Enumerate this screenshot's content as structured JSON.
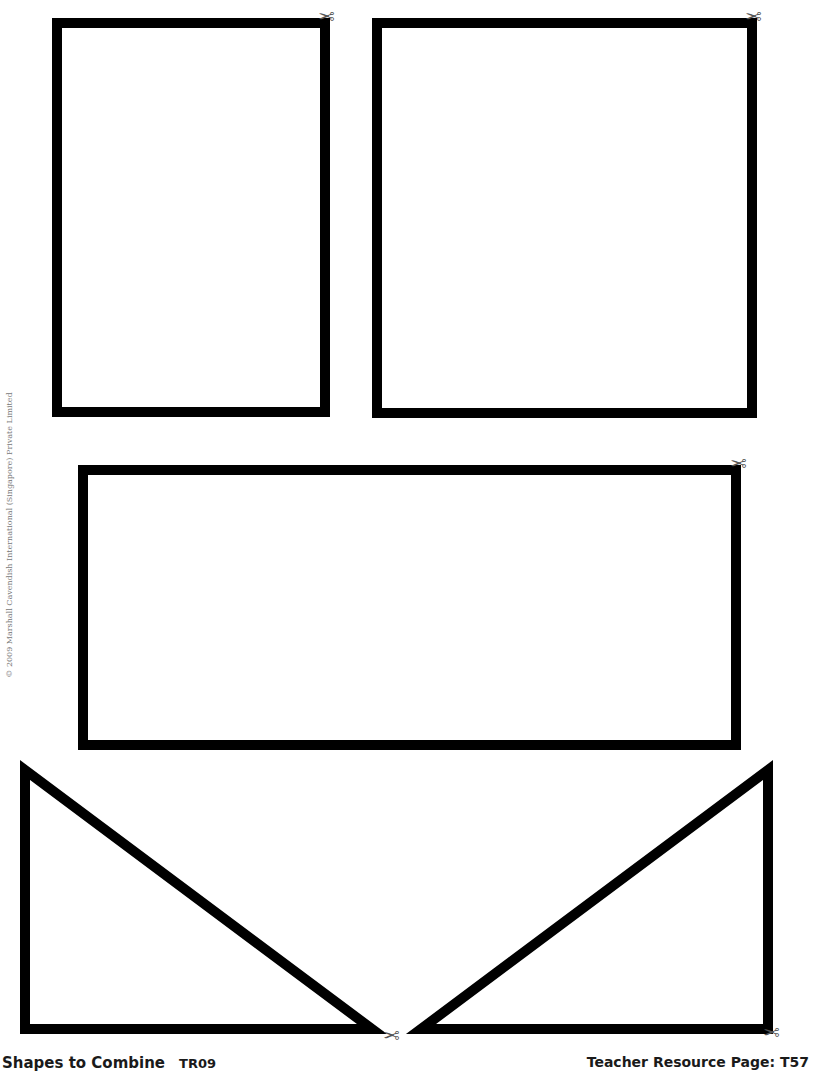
{
  "page": {
    "title": "Shapes to Combine",
    "code": "TR09",
    "page_label": "Teacher Resource Page: T57",
    "copyright": "© 2009 Marshall Cavendish International (Singapore) Private Limited"
  },
  "shapes": [
    {
      "type": "rectangle",
      "name": "rectangle-small",
      "x": 57,
      "y": 23,
      "w": 268,
      "h": 389
    },
    {
      "type": "rectangle",
      "name": "rectangle-square",
      "x": 377,
      "y": 23,
      "w": 375,
      "h": 390
    },
    {
      "type": "rectangle",
      "name": "rectangle-wide",
      "x": 83,
      "y": 470,
      "w": 653,
      "h": 275
    },
    {
      "type": "triangle",
      "name": "triangle-left",
      "points": "25,770 25,1029 372,1029"
    },
    {
      "type": "triangle",
      "name": "triangle-right",
      "points": "768,770 768,1029 421,1029"
    }
  ],
  "scissors": {
    "glyph": "✂",
    "positions": [
      {
        "x": 318,
        "y": 6
      },
      {
        "x": 745,
        "y": 6
      },
      {
        "x": 730,
        "y": 453
      },
      {
        "x": 383,
        "y": 1025
      },
      {
        "x": 763,
        "y": 1022
      }
    ]
  },
  "style": {
    "stroke_color": "#000000",
    "stroke_width": 10
  }
}
